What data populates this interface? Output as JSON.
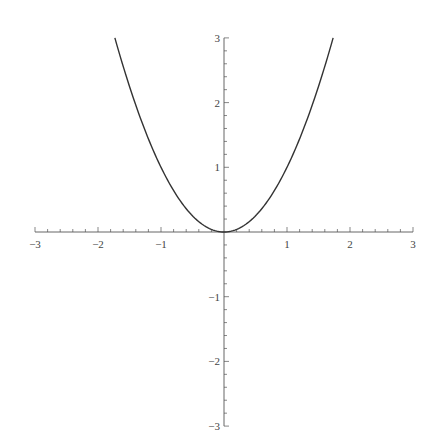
{
  "chart_data": {
    "type": "line",
    "title": "",
    "xlabel": "",
    "ylabel": "",
    "function": "y = x^2",
    "xlim": [
      -3,
      3
    ],
    "ylim": [
      -3,
      3
    ],
    "grid": false,
    "legend": null,
    "axes_style": "centered at origin",
    "x_ticks": [
      -3,
      -2,
      -1,
      1,
      2,
      3
    ],
    "x_tick_labels": [
      "−3",
      "−2",
      "−1",
      "1",
      "2",
      "3"
    ],
    "y_ticks": [
      3,
      2,
      1,
      -1,
      -2,
      -3
    ],
    "y_tick_labels": [
      "3",
      "2",
      "1",
      "−1",
      "−2",
      "−3"
    ],
    "minor_tick_step": 0.2,
    "series": [
      {
        "name": "x^2",
        "color": "#333333",
        "x": [
          -1.732,
          -1.5,
          -1.25,
          -1.0,
          -0.75,
          -0.5,
          -0.25,
          0.0,
          0.25,
          0.5,
          0.75,
          1.0,
          1.25,
          1.5,
          1.732
        ],
        "y": [
          3.0,
          2.25,
          1.5625,
          1.0,
          0.5625,
          0.25,
          0.0625,
          0.0,
          0.0625,
          0.25,
          0.5625,
          1.0,
          1.5625,
          2.25,
          3.0
        ]
      }
    ]
  },
  "colors": {
    "axis": "#555555",
    "curve": "#333333",
    "background": "#ffffff"
  }
}
